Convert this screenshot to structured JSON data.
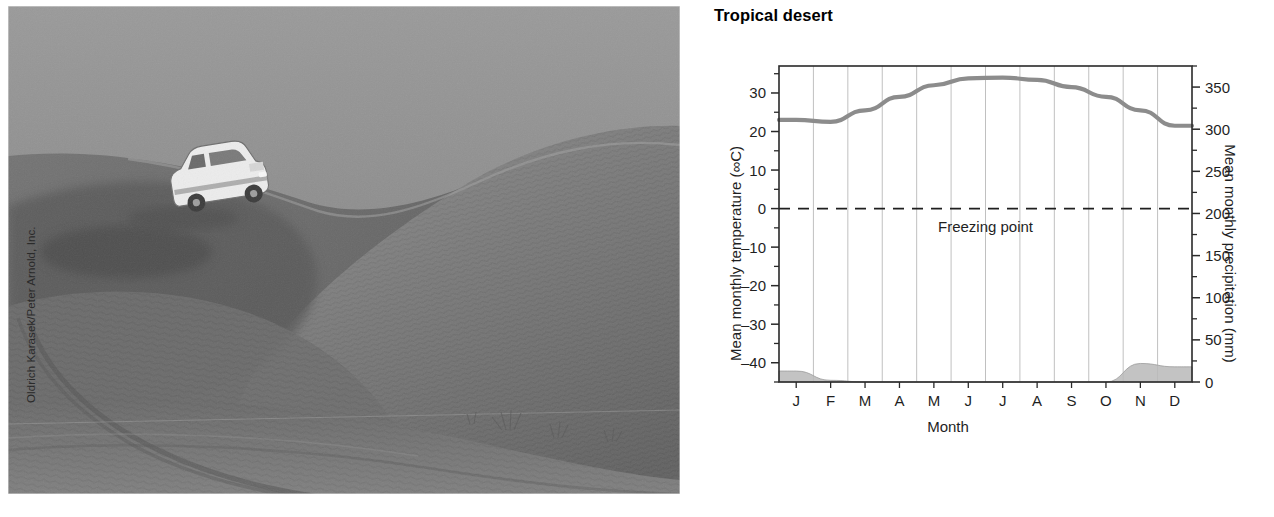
{
  "photo": {
    "alt_name": "desert-dune-suv-photograph",
    "credit": "Oldrich Karasek/Peter Arnold, Inc.",
    "subject": "white SUV parked on a large sand dune in a tropical desert"
  },
  "chart_data": {
    "type": "line",
    "title": "Tropical desert",
    "xlabel": "Month",
    "ylabel": "Mean monthly temperature (∞C)",
    "y2label": "Mean monthly precipitation (mm)",
    "categories": [
      "J",
      "F",
      "M",
      "A",
      "M",
      "J",
      "J",
      "A",
      "S",
      "O",
      "N",
      "D"
    ],
    "ylim": [
      -45,
      37
    ],
    "yticks": [
      30,
      20,
      10,
      0,
      -10,
      -20,
      -30,
      -40
    ],
    "ytick_labels": [
      "30",
      "20",
      "10",
      "0",
      "–10",
      "–20",
      "–30",
      "–40"
    ],
    "y2lim": [
      0,
      375
    ],
    "y2ticks": [
      350,
      300,
      250,
      200,
      150,
      100,
      50,
      0
    ],
    "y2tick_labels": [
      "350",
      "300",
      "250",
      "200",
      "150",
      "100",
      "50",
      "0"
    ],
    "grid": "vertical",
    "legend": "none",
    "annotations": [
      {
        "text": "Freezing point",
        "y_value": 0,
        "style": "dashed-line-label"
      }
    ],
    "series": [
      {
        "name": "Mean monthly temperature",
        "axis": "left",
        "unit": "∞C",
        "kind": "line",
        "color": "#8c8c8c",
        "values": [
          23.0,
          22.5,
          25.5,
          29.0,
          32.0,
          33.8,
          34.0,
          33.4,
          31.5,
          29.0,
          25.5,
          21.5
        ]
      },
      {
        "name": "Mean monthly precipitation",
        "axis": "right",
        "unit": "mm",
        "kind": "area",
        "color": "#b8b8b8",
        "values": [
          13,
          2,
          0,
          0,
          0,
          0,
          0,
          0,
          0,
          0,
          22,
          18
        ]
      }
    ]
  }
}
